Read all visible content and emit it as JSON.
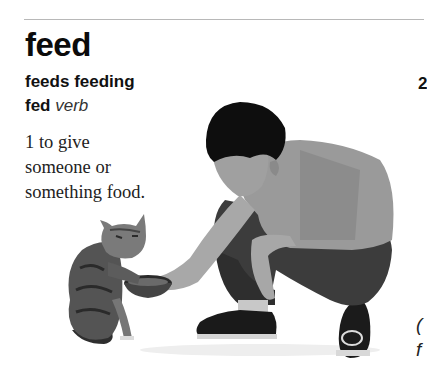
{
  "entry": {
    "headword": "feed",
    "inflections": "feeds feeding",
    "past": "fed",
    "part_of_speech": "verb",
    "sense_1": {
      "number": "1",
      "text_line1": "to give",
      "text_line2": "someone or",
      "text_line3": "something food."
    },
    "sense_2_number_partial": "2"
  },
  "illustration": {
    "description": "boy crouching and offering a bowl of food to a tabby cat",
    "subjects": [
      "boy",
      "cat",
      "food-bowl"
    ]
  },
  "cut_off_text": {
    "line1": "(",
    "line2": "f"
  }
}
